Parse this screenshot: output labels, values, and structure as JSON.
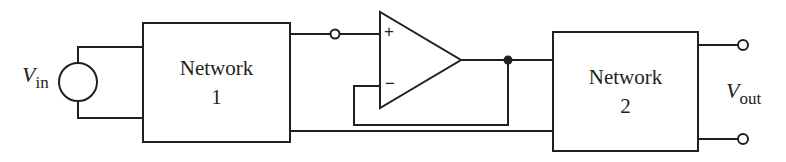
{
  "diagram": {
    "type": "circuit",
    "colors": {
      "stroke": "#231f20",
      "background": "#ffffff"
    },
    "source": {
      "label_main": "V",
      "label_sub": "in",
      "symbol": "voltage-source-circle"
    },
    "network1": {
      "line1": "Network",
      "line2": "1"
    },
    "network2": {
      "line1": "Network",
      "line2": "2"
    },
    "opamp": {
      "plus": "+",
      "minus": "−",
      "configuration": "voltage-follower (unity-gain buffer)"
    },
    "output": {
      "label_main": "V",
      "label_sub": "out",
      "terminals": 2
    },
    "connections": [
      "Vin source -> Network 1 input (two wires)",
      "Network 1 top output -> terminal -> op-amp non-inverting input (+)",
      "Op-amp output -> node -> Network 2 input",
      "Node -> feedback wire -> op-amp inverting input (−)",
      "Network 1 bottom output -> Network 2 bottom input (common line)",
      "Network 2 outputs -> Vout terminals"
    ]
  }
}
